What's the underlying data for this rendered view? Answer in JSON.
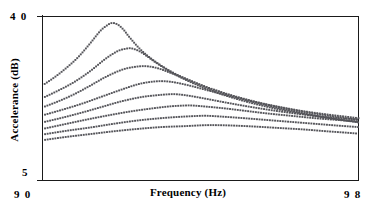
{
  "figure": {
    "name": "accelerance-frequency-response"
  },
  "axes": {
    "x": {
      "label": "Frequency (Hz)",
      "min": 90,
      "max": 98,
      "tick_labels": [
        "9 0",
        "9 8"
      ]
    },
    "y": {
      "label": "Accelerance (dB)",
      "min": 5,
      "max": 40,
      "tick_labels": [
        "4 0",
        "5"
      ]
    }
  },
  "style": {
    "axis_color": "#1a1a1a",
    "curve_color": "#55555a",
    "background": "#ffffff",
    "dot_radius": 0.95,
    "dot_spacing": 2.6
  },
  "chart_data": {
    "type": "line",
    "title": "",
    "xlabel": "Frequency (Hz)",
    "ylabel": "Accelerance (dB)",
    "xlim": [
      90,
      98
    ],
    "ylim": [
      5,
      40
    ],
    "grid": false,
    "legend": null,
    "linestyle": "dotted",
    "series": [
      {
        "name": "curve-1",
        "peak_frequency": 91.75,
        "peak_value": 38.6,
        "x": [
          90.0,
          90.3,
          90.6,
          90.9,
          91.2,
          91.45,
          91.6,
          91.75,
          91.9,
          92.05,
          92.2,
          92.5,
          92.9,
          93.4,
          94.0,
          94.6,
          95.2,
          95.8,
          96.4,
          97.0,
          97.6,
          98.0
        ],
        "y": [
          25.3,
          27.0,
          29.0,
          31.3,
          34.2,
          36.8,
          37.9,
          38.6,
          38.3,
          37.2,
          35.6,
          32.8,
          30.1,
          27.6,
          25.4,
          23.6,
          22.1,
          20.8,
          19.7,
          18.7,
          17.9,
          17.4
        ]
      },
      {
        "name": "curve-2",
        "peak_frequency": 92.25,
        "peak_value": 33.2,
        "x": [
          90.0,
          90.4,
          90.8,
          91.2,
          91.6,
          91.9,
          92.1,
          92.25,
          92.45,
          92.65,
          92.9,
          93.3,
          93.8,
          94.4,
          95.0,
          95.6,
          96.2,
          96.8,
          97.4,
          98.0
        ],
        "y": [
          22.6,
          24.2,
          26.0,
          28.3,
          31.0,
          32.6,
          33.1,
          33.2,
          32.6,
          31.5,
          30.0,
          27.9,
          25.8,
          23.8,
          22.2,
          20.9,
          19.8,
          18.9,
          18.1,
          17.5
        ]
      },
      {
        "name": "curve-3",
        "peak_frequency": 92.6,
        "peak_value": 29.4,
        "x": [
          90.0,
          90.4,
          90.8,
          91.2,
          91.6,
          92.0,
          92.3,
          92.6,
          92.9,
          93.2,
          93.6,
          94.1,
          94.7,
          95.3,
          95.9,
          96.5,
          97.1,
          97.6,
          98.0
        ],
        "y": [
          20.6,
          21.9,
          23.4,
          25.2,
          27.1,
          28.6,
          29.2,
          29.4,
          29.0,
          28.1,
          26.8,
          25.1,
          23.4,
          22.0,
          20.8,
          19.8,
          19.0,
          18.4,
          18.0
        ]
      },
      {
        "name": "curve-4",
        "peak_frequency": 93.0,
        "peak_value": 26.2,
        "x": [
          90.0,
          90.5,
          91.0,
          91.5,
          92.0,
          92.4,
          92.7,
          93.0,
          93.3,
          93.7,
          94.2,
          94.8,
          95.4,
          96.0,
          96.6,
          97.2,
          97.7,
          98.0
        ],
        "y": [
          18.9,
          20.1,
          21.4,
          22.9,
          24.4,
          25.5,
          26.0,
          26.2,
          26.0,
          25.3,
          24.2,
          22.9,
          21.7,
          20.7,
          19.8,
          19.1,
          18.6,
          18.3
        ]
      },
      {
        "name": "curve-5",
        "peak_frequency": 93.4,
        "peak_value": 23.4,
        "x": [
          90.0,
          90.5,
          91.0,
          91.5,
          92.0,
          92.5,
          92.9,
          93.2,
          93.4,
          93.7,
          94.1,
          94.6,
          95.2,
          95.8,
          96.4,
          97.0,
          97.5,
          98.0
        ],
        "y": [
          17.4,
          18.4,
          19.5,
          20.7,
          21.9,
          22.8,
          23.2,
          23.4,
          23.4,
          23.1,
          22.5,
          21.7,
          20.8,
          20.0,
          19.3,
          18.7,
          18.3,
          18.0
        ]
      },
      {
        "name": "curve-6",
        "peak_frequency": 93.8,
        "peak_value": 21.0,
        "x": [
          90.0,
          90.5,
          91.0,
          91.6,
          92.2,
          92.7,
          93.2,
          93.6,
          93.8,
          94.1,
          94.6,
          95.1,
          95.7,
          96.3,
          96.9,
          97.5,
          98.0
        ],
        "y": [
          16.0,
          16.9,
          17.8,
          18.8,
          19.7,
          20.3,
          20.8,
          21.0,
          21.0,
          20.8,
          20.4,
          19.9,
          19.3,
          18.8,
          18.3,
          17.9,
          17.6
        ]
      },
      {
        "name": "curve-7",
        "peak_frequency": 94.2,
        "peak_value": 18.8,
        "x": [
          90.0,
          90.6,
          91.2,
          91.8,
          92.4,
          93.0,
          93.5,
          94.0,
          94.2,
          94.6,
          95.1,
          95.7,
          96.3,
          96.9,
          97.5,
          98.0
        ],
        "y": [
          14.8,
          15.6,
          16.3,
          17.1,
          17.8,
          18.3,
          18.6,
          18.8,
          18.8,
          18.6,
          18.3,
          17.9,
          17.5,
          17.1,
          16.7,
          16.4
        ]
      },
      {
        "name": "curve-8",
        "peak_frequency": 94.5,
        "peak_value": 16.8,
        "x": [
          90.0,
          90.6,
          91.2,
          91.8,
          92.4,
          93.0,
          93.6,
          94.1,
          94.5,
          94.9,
          95.4,
          96.0,
          96.6,
          97.2,
          97.7,
          98.0
        ],
        "y": [
          13.6,
          14.3,
          14.9,
          15.5,
          16.0,
          16.4,
          16.6,
          16.8,
          16.8,
          16.7,
          16.5,
          16.2,
          15.9,
          15.5,
          15.2,
          15.0
        ]
      }
    ]
  }
}
